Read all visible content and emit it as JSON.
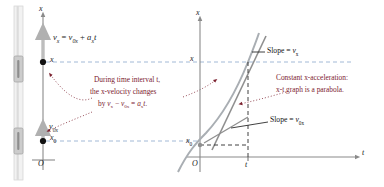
{
  "figure": {
    "left_panel": {
      "axis_label_x": "x",
      "origin_label": "O",
      "position_top_label": "x",
      "position_bottom_label": "x",
      "position_bottom_sub": "0",
      "velocity_top_formula": {
        "v": "v",
        "v_sub": "x",
        "equals": "=",
        "v0": "v",
        "v0_sub": "0x",
        "plus": "+",
        "a": "a",
        "a_sub": "x",
        "t": "t",
        "full": "v_x = v_0x + a_x t"
      },
      "velocity_bottom_label": {
        "v": "v",
        "v_sub": "0x",
        "full": "v_0x"
      }
    },
    "annotation_center": {
      "line1": "During time interval t,",
      "line2": "the x-velocity changes",
      "line3_by": "by",
      "line3_vx": "v",
      "line3_vx_sub": "x",
      "line3_minus": "−",
      "line3_v0x": "v",
      "line3_v0x_sub": "0x",
      "line3_eq": "=",
      "line3_ax": "a",
      "line3_ax_sub": "x",
      "line3_t": "t."
    },
    "annotation_right": {
      "line1": "Constant x-acceleration:",
      "line2": "x-t graph is a parabola."
    },
    "right_panel": {
      "axis_label_x": "x",
      "axis_label_t": "t",
      "origin_label": "O",
      "tick_label_t": "t",
      "tick_label_x": "x",
      "tick_label_x0": "x",
      "tick_label_x0_sub": "0",
      "slope_tangent": {
        "text": "Slope",
        "equals": "=",
        "v": "v",
        "v_sub": "x",
        "full": "Slope = v_x"
      },
      "slope_initial": {
        "text": "Slope",
        "equals": "=",
        "v": "v",
        "v_sub": "0x",
        "full": "Slope = v_0x"
      }
    },
    "colors": {
      "annotation": "#7c2230",
      "dashed_blue": "#8aa7cc",
      "curve": "#9aa0a6",
      "arrow_gray": "#b8b8b8",
      "axis": "#7a7a7a",
      "dot": "#111111",
      "slider": "#cfcfcf"
    }
  }
}
